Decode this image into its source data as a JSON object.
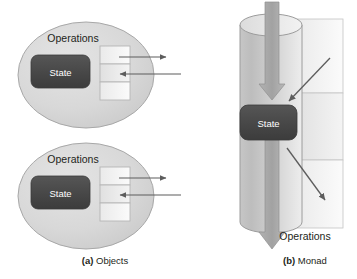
{
  "figure": {
    "panels": [
      {
        "id": "objects",
        "caption_marker": "(a)",
        "caption_text": " Objects",
        "objects": [
          {
            "id": "object-top",
            "operations_label": "Operations",
            "state_label": "State",
            "cells": 3,
            "arrows": [
              {
                "name": "outgoing-arrow",
                "direction": "right",
                "from_cell": 1
              },
              {
                "name": "incoming-arrow",
                "direction": "left",
                "to_cell": 2
              }
            ]
          },
          {
            "id": "object-bottom",
            "operations_label": "Operations",
            "state_label": "State",
            "cells": 3,
            "arrows": [
              {
                "name": "outgoing-arrow",
                "direction": "right",
                "from_cell": 1
              },
              {
                "name": "incoming-arrow",
                "direction": "left",
                "to_cell": 2
              }
            ]
          }
        ]
      },
      {
        "id": "monad",
        "caption_marker": "(b)",
        "caption_text": " Monad",
        "operations_label": "Operations",
        "state_label": "State",
        "cells": 3,
        "arrows": [
          {
            "name": "flow-arrow-in",
            "direction": "down"
          },
          {
            "name": "flow-arrow-out",
            "direction": "down"
          },
          {
            "name": "operation-in-arrow",
            "direction": "down-left"
          },
          {
            "name": "operation-out-arrow",
            "direction": "down-right"
          }
        ]
      }
    ]
  },
  "colors": {
    "background": "#ffffff",
    "ellipse_fill": "#d9d9d9",
    "ellipse_stroke": "#a6a6a6",
    "state_fill": "#464646",
    "state_text": "#ffffff",
    "cell_light": "#f2f2f2",
    "cell_mid": "#e6e6e6",
    "cell_stroke": "#b3b3b3",
    "arrow_stroke": "#595959",
    "cylinder_left": "#bfbfbf",
    "cylinder_right": "#ededed",
    "block_arrow": "#a6a6a6",
    "text": "#231f20"
  }
}
